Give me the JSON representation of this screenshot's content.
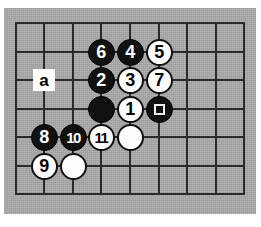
{
  "figure": {
    "kind": "go-board-diagram",
    "board_background_color": "#a8a8a8",
    "grid_line_color": "#2a2a2a",
    "black_stone_color": "#111111",
    "white_stone_color": "#fdfdfd",
    "page_background_color": "#ffffff",
    "columns": 9,
    "rows": 7,
    "grid_x": [
      15,
      43,
      72,
      100,
      129,
      158,
      186,
      215,
      243
    ],
    "grid_y": [
      22,
      51,
      79,
      108,
      136,
      165,
      193
    ],
    "stone_diameter": 27
  },
  "stones": [
    {
      "name": "stone-6",
      "color": "black",
      "label": "6",
      "col": 3,
      "row": 1,
      "marker": "none"
    },
    {
      "name": "stone-4",
      "color": "black",
      "label": "4",
      "col": 4,
      "row": 1,
      "marker": "none"
    },
    {
      "name": "stone-5",
      "color": "white",
      "label": "5",
      "col": 5,
      "row": 1,
      "marker": "none"
    },
    {
      "name": "stone-2",
      "color": "black",
      "label": "2",
      "col": 3,
      "row": 2,
      "marker": "none"
    },
    {
      "name": "stone-3",
      "color": "white",
      "label": "3",
      "col": 4,
      "row": 2,
      "marker": "none"
    },
    {
      "name": "stone-7",
      "color": "white",
      "label": "7",
      "col": 5,
      "row": 2,
      "marker": "none"
    },
    {
      "name": "stone-black-plain-c3r3",
      "color": "black",
      "label": "",
      "col": 3,
      "row": 3,
      "marker": "none"
    },
    {
      "name": "stone-1",
      "color": "white",
      "label": "1",
      "col": 4,
      "row": 3,
      "marker": "none"
    },
    {
      "name": "stone-black-marked-c5r3",
      "color": "black",
      "label": "",
      "col": 5,
      "row": 3,
      "marker": "square"
    },
    {
      "name": "stone-8",
      "color": "black",
      "label": "8",
      "col": 1,
      "row": 4,
      "marker": "none"
    },
    {
      "name": "stone-10",
      "color": "black",
      "label": "10",
      "col": 2,
      "row": 4,
      "marker": "none"
    },
    {
      "name": "stone-11",
      "color": "white",
      "label": "11",
      "col": 3,
      "row": 4,
      "marker": "none"
    },
    {
      "name": "stone-white-plain-c4r4",
      "color": "white",
      "label": "",
      "col": 4,
      "row": 4,
      "marker": "none"
    },
    {
      "name": "stone-9",
      "color": "white",
      "label": "9",
      "col": 1,
      "row": 5,
      "marker": "none"
    },
    {
      "name": "stone-white-plain-c2r5",
      "color": "white",
      "label": "",
      "col": 2,
      "row": 5,
      "marker": "none"
    }
  ],
  "point_labels": [
    {
      "name": "point-label-a",
      "label": "a",
      "col": 1,
      "row": 2
    }
  ]
}
